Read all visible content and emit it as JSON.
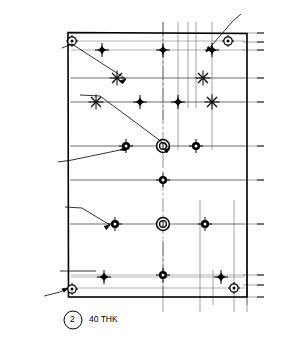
{
  "drawing": {
    "title": "Hole pattern plate – dimensioned engineering drawing",
    "detail_balloon": "2",
    "thickness_note": "40 THK",
    "plate": {
      "x_min": 0,
      "x_max": 280,
      "y_min": 0,
      "y_max": 760,
      "left_px": 68,
      "right_px": 247,
      "top_px": 33,
      "bottom_px": 297
    },
    "callouts": [
      {
        "name": "callout-4x-dia15",
        "text": "4 x  Ø 15",
        "x": 20,
        "y": 43
      },
      {
        "name": "callout-2x-dia26",
        "text": "2 x  Ø 26",
        "x": 20,
        "y": 74
      },
      {
        "name": "callout-dia50-cbore",
        "text": "Ø 50 ⌴",
        "x": 20,
        "y": 84
      },
      {
        "name": "callout-20-deep",
        "text": "20 ▼",
        "x": 22,
        "y": 94
      },
      {
        "name": "callout-3x-dia20",
        "text": "3 x  Ø 20",
        "x": 9,
        "y": 161
      },
      {
        "name": "callout-3x-dia26",
        "text": "3 x  Ø 26",
        "x": 16,
        "y": 206
      },
      {
        "name": "callout-4x-dia16",
        "text": "4 x  Ø 16",
        "x": 6,
        "y": 296
      },
      {
        "name": "callout-7x-dia105",
        "text": "7 x   Ø 10.5",
        "x": 244,
        "y": 8
      },
      {
        "name": "callout-60",
        "text": "60",
        "x": 47,
        "y": 268
      }
    ],
    "top_dimensions": [
      {
        "label": "0",
        "px": 163
      },
      {
        "label": "65",
        "px": 178
      },
      {
        "label": "100",
        "px": 188
      },
      {
        "label": "125",
        "px": 196
      },
      {
        "label": "165",
        "px": 212
      }
    ],
    "bottom_dimensions": [
      {
        "label": "0",
        "px": 163
      },
      {
        "label": "140",
        "px": 200
      },
      {
        "label": "255",
        "px": 234
      },
      {
        "label": "280",
        "px": 247
      }
    ],
    "right_dimensions": [
      {
        "label": "760",
        "px": 33
      },
      {
        "label": "735",
        "px": 42
      },
      {
        "label": "710",
        "px": 50
      },
      {
        "label": "630",
        "px": 78
      },
      {
        "label": "560",
        "px": 102
      },
      {
        "label": "430",
        "px": 146
      },
      {
        "label": "330",
        "px": 180
      },
      {
        "label": "200",
        "px": 224
      },
      {
        "label": "50",
        "px": 275
      },
      {
        "label": "25",
        "px": 285
      },
      {
        "label": "0",
        "px": 297
      }
    ],
    "holes": [
      {
        "name": "hole-dia10_5-tl",
        "type": "dia10.5",
        "cx": 72,
        "cy": 41
      },
      {
        "name": "hole-dia10_5-tr",
        "type": "dia10.5",
        "cx": 228,
        "cy": 41
      },
      {
        "name": "hole-dia10_5-bl",
        "type": "dia10.5",
        "cx": 72,
        "cy": 289
      },
      {
        "name": "hole-dia10_5-br",
        "type": "dia10.5",
        "cx": 234,
        "cy": 288
      },
      {
        "name": "hole-dia16-tl",
        "type": "dia16",
        "cx": 102,
        "cy": 50
      },
      {
        "name": "hole-dia16-tm",
        "type": "dia16",
        "cx": 163,
        "cy": 50
      },
      {
        "name": "hole-dia16-tr",
        "type": "dia16",
        "cx": 212,
        "cy": 50
      },
      {
        "name": "hole-dia15-a",
        "type": "dia15",
        "cx": 117,
        "cy": 78
      },
      {
        "name": "hole-dia15-b",
        "type": "dia15",
        "cx": 203,
        "cy": 78
      },
      {
        "name": "hole-dia15-c",
        "type": "dia15",
        "cx": 96,
        "cy": 102
      },
      {
        "name": "hole-dia15-d",
        "type": "dia15",
        "cx": 212,
        "cy": 102
      },
      {
        "name": "hole-dia16-m1",
        "type": "dia16",
        "cx": 140,
        "cy": 102
      },
      {
        "name": "hole-dia16-m2",
        "type": "dia16",
        "cx": 178,
        "cy": 102
      },
      {
        "name": "hole-dia20-l",
        "type": "dia20",
        "cx": 126,
        "cy": 146
      },
      {
        "name": "hole-cbore-430",
        "type": "counterbore",
        "cx": 163,
        "cy": 146
      },
      {
        "name": "hole-dia20-r",
        "type": "dia20",
        "cx": 196,
        "cy": 146
      },
      {
        "name": "hole-dia20-330",
        "type": "dia20",
        "cx": 163,
        "cy": 180
      },
      {
        "name": "hole-dia26-l",
        "type": "dia26",
        "cx": 115,
        "cy": 224
      },
      {
        "name": "hole-cbore-200",
        "type": "counterbore",
        "cx": 163,
        "cy": 224
      },
      {
        "name": "hole-dia26-r",
        "type": "dia26",
        "cx": 205,
        "cy": 224
      },
      {
        "name": "hole-dia26-50",
        "type": "dia26",
        "cx": 163,
        "cy": 275
      },
      {
        "name": "hole-dia16-b1",
        "type": "dia16",
        "cx": 104,
        "cy": 277
      },
      {
        "name": "hole-dia16-b2",
        "type": "dia16",
        "cx": 221,
        "cy": 277
      }
    ]
  }
}
